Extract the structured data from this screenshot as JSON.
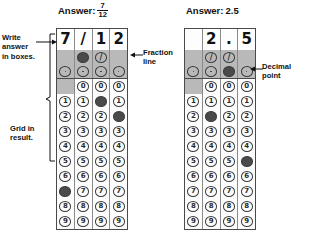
{
  "page": {
    "background": "#ffffff",
    "fill_color": "#4a4a4a",
    "band_color": "#b9b9b9",
    "border_color": "#4a4a4a"
  },
  "annotations": {
    "write_answer": "Write\nanswer\nin boxes.",
    "grid_in_result": "Grid in\nresult.",
    "fraction_line": "Fraction\nline",
    "decimal_point": "Decimal\npoint",
    "arrow_left": "→",
    "arrow_right": "←"
  },
  "grids": [
    {
      "id": "fraction-grid",
      "header": {
        "label": "Answer:",
        "type": "fraction",
        "numerator": "7",
        "denominator": "12",
        "value": "7/12"
      },
      "columns": 4,
      "written_answer": [
        "7",
        "/",
        "1",
        "2"
      ],
      "slash_row": {
        "symbol": "/",
        "present": [
          false,
          true,
          true,
          false
        ],
        "filled": [
          false,
          true,
          false,
          false
        ]
      },
      "decimal_row": {
        "symbol": ".",
        "present": [
          true,
          true,
          true,
          true
        ],
        "filled": [
          false,
          false,
          false,
          false
        ]
      },
      "digit_rows": [
        {
          "digit": "0",
          "present": [
            false,
            true,
            true,
            true
          ],
          "filled": [
            false,
            false,
            false,
            false
          ]
        },
        {
          "digit": "1",
          "present": [
            true,
            true,
            true,
            true
          ],
          "filled": [
            false,
            false,
            true,
            false
          ]
        },
        {
          "digit": "2",
          "present": [
            true,
            true,
            true,
            true
          ],
          "filled": [
            false,
            false,
            false,
            true
          ]
        },
        {
          "digit": "3",
          "present": [
            true,
            true,
            true,
            true
          ],
          "filled": [
            false,
            false,
            false,
            false
          ]
        },
        {
          "digit": "4",
          "present": [
            true,
            true,
            true,
            true
          ],
          "filled": [
            false,
            false,
            false,
            false
          ]
        },
        {
          "digit": "5",
          "present": [
            true,
            true,
            true,
            true
          ],
          "filled": [
            false,
            false,
            false,
            false
          ]
        },
        {
          "digit": "6",
          "present": [
            true,
            true,
            true,
            true
          ],
          "filled": [
            false,
            false,
            false,
            false
          ]
        },
        {
          "digit": "7",
          "present": [
            true,
            true,
            true,
            true
          ],
          "filled": [
            true,
            false,
            false,
            false
          ]
        },
        {
          "digit": "8",
          "present": [
            true,
            true,
            true,
            true
          ],
          "filled": [
            false,
            false,
            false,
            false
          ]
        },
        {
          "digit": "9",
          "present": [
            true,
            true,
            true,
            true
          ],
          "filled": [
            false,
            false,
            false,
            false
          ]
        }
      ]
    },
    {
      "id": "decimal-grid",
      "header": {
        "label": "Answer:",
        "type": "decimal",
        "numerator": "",
        "denominator": "",
        "value": "2.5"
      },
      "columns": 4,
      "written_answer": [
        "",
        "2",
        ".",
        "5"
      ],
      "slash_row": {
        "symbol": "/",
        "present": [
          false,
          true,
          true,
          false
        ],
        "filled": [
          false,
          false,
          false,
          false
        ]
      },
      "decimal_row": {
        "symbol": ".",
        "present": [
          true,
          true,
          true,
          true
        ],
        "filled": [
          false,
          false,
          true,
          false
        ]
      },
      "digit_rows": [
        {
          "digit": "0",
          "present": [
            false,
            true,
            true,
            true
          ],
          "filled": [
            false,
            false,
            false,
            false
          ]
        },
        {
          "digit": "1",
          "present": [
            true,
            true,
            true,
            true
          ],
          "filled": [
            false,
            false,
            false,
            false
          ]
        },
        {
          "digit": "2",
          "present": [
            true,
            true,
            true,
            true
          ],
          "filled": [
            false,
            true,
            false,
            false
          ]
        },
        {
          "digit": "3",
          "present": [
            true,
            true,
            true,
            true
          ],
          "filled": [
            false,
            false,
            false,
            false
          ]
        },
        {
          "digit": "4",
          "present": [
            true,
            true,
            true,
            true
          ],
          "filled": [
            false,
            false,
            false,
            false
          ]
        },
        {
          "digit": "5",
          "present": [
            true,
            true,
            true,
            true
          ],
          "filled": [
            false,
            false,
            false,
            true
          ]
        },
        {
          "digit": "6",
          "present": [
            true,
            true,
            true,
            true
          ],
          "filled": [
            false,
            false,
            false,
            false
          ]
        },
        {
          "digit": "7",
          "present": [
            true,
            true,
            true,
            true
          ],
          "filled": [
            false,
            false,
            false,
            false
          ]
        },
        {
          "digit": "8",
          "present": [
            true,
            true,
            true,
            true
          ],
          "filled": [
            false,
            false,
            false,
            false
          ]
        },
        {
          "digit": "9",
          "present": [
            true,
            true,
            true,
            true
          ],
          "filled": [
            false,
            false,
            false,
            false
          ]
        }
      ]
    }
  ]
}
